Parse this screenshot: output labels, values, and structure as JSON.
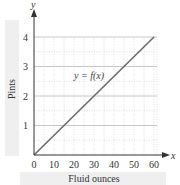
{
  "chart_data": {
    "type": "line",
    "title": "",
    "xlabel": "Fluid ounces",
    "ylabel": "Pints",
    "x_axis_symbol": "x",
    "y_axis_symbol": "y",
    "function_label": "y = f(x)",
    "x_ticks": [
      0,
      10,
      20,
      30,
      40,
      50,
      60
    ],
    "y_ticks": [
      1,
      2,
      3,
      4
    ],
    "xlim": [
      0,
      60
    ],
    "ylim": [
      0,
      4
    ],
    "grid": true,
    "legend": "none",
    "series": [
      {
        "name": "y = f(x)",
        "x": [
          0,
          60
        ],
        "y": [
          0,
          4
        ]
      }
    ]
  },
  "colors": {
    "axis": "#333333",
    "line": "#6b6b6b",
    "major_grid": "#c8c8c8",
    "minor_grid": "#d8d8d8",
    "label_panel": "#efefef",
    "text": "#333333"
  }
}
